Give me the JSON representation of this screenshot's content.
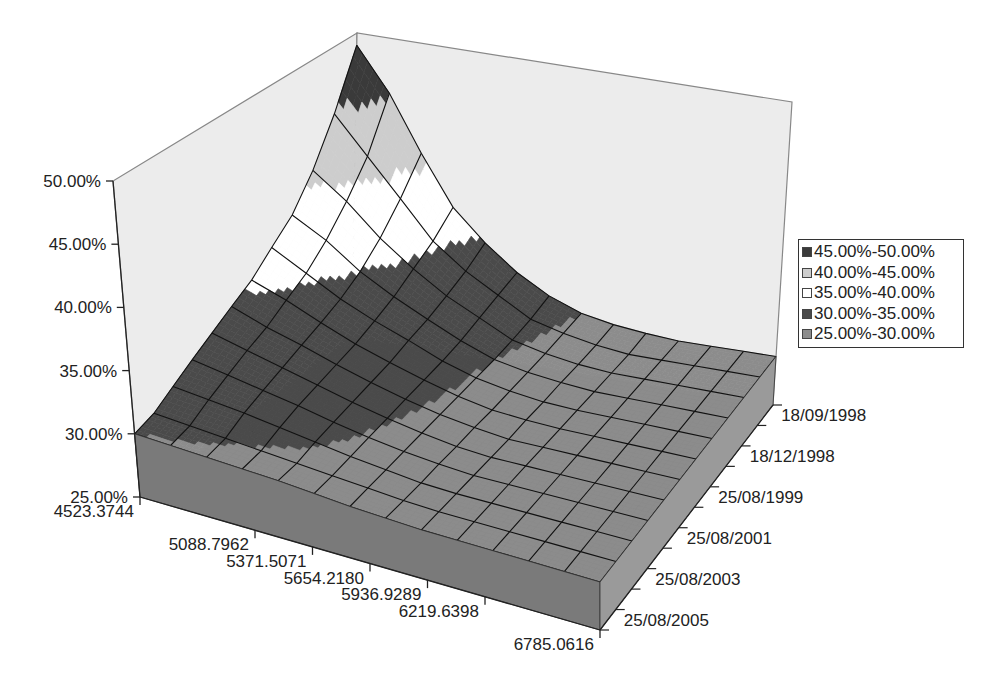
{
  "chart_data": {
    "type": "surface",
    "title": "",
    "xlabel": "",
    "ylabel": "",
    "zlabel": "",
    "x_categories": [
      "4523.3744",
      "5088.7962",
      "5371.5071",
      "5654.2180",
      "5936.9289",
      "6219.6398",
      "6785.0616"
    ],
    "y_categories": [
      "18/09/1998",
      "18/12/1998",
      "25/08/1999",
      "25/08/2001",
      "25/08/2003",
      "25/08/2005"
    ],
    "z_ticks": [
      "25.00%",
      "30.00%",
      "35.00%",
      "40.00%",
      "45.00%",
      "50.00%"
    ],
    "zlim": [
      0.25,
      0.5
    ],
    "grid_rows_note": "surface grid has 13 x-steps by 11 y-steps (more grid lines than labeled ticks)",
    "values_by_date": [
      {
        "date_index": 0,
        "values": [
          0.49,
          0.455,
          0.41,
          0.37,
          0.345,
          0.325,
          0.31,
          0.3,
          0.295,
          0.292,
          0.29,
          0.29,
          0.29,
          0.29
        ]
      },
      {
        "date_index": 1,
        "values": [
          0.445,
          0.415,
          0.385,
          0.355,
          0.335,
          0.32,
          0.305,
          0.298,
          0.293,
          0.29,
          0.29,
          0.29,
          0.29,
          0.29
        ]
      },
      {
        "date_index": 2,
        "values": [
          0.41,
          0.39,
          0.365,
          0.345,
          0.328,
          0.315,
          0.302,
          0.296,
          0.292,
          0.29,
          0.29,
          0.29,
          0.29,
          0.29
        ]
      },
      {
        "date_index": 3,
        "values": [
          0.385,
          0.37,
          0.35,
          0.335,
          0.322,
          0.31,
          0.3,
          0.295,
          0.292,
          0.29,
          0.29,
          0.29,
          0.29,
          0.29
        ]
      },
      {
        "date_index": 4,
        "values": [
          0.37,
          0.355,
          0.34,
          0.328,
          0.318,
          0.307,
          0.299,
          0.294,
          0.291,
          0.29,
          0.29,
          0.29,
          0.29,
          0.29
        ]
      },
      {
        "date_index": 5,
        "values": [
          0.355,
          0.345,
          0.333,
          0.322,
          0.313,
          0.305,
          0.298,
          0.293,
          0.291,
          0.29,
          0.29,
          0.29,
          0.29,
          0.29
        ]
      },
      {
        "date_index": 6,
        "values": [
          0.345,
          0.335,
          0.327,
          0.318,
          0.31,
          0.303,
          0.297,
          0.293,
          0.29,
          0.29,
          0.29,
          0.29,
          0.29,
          0.29
        ]
      },
      {
        "date_index": 7,
        "values": [
          0.335,
          0.328,
          0.321,
          0.314,
          0.307,
          0.301,
          0.296,
          0.292,
          0.29,
          0.29,
          0.29,
          0.29,
          0.29,
          0.29
        ]
      },
      {
        "date_index": 8,
        "values": [
          0.325,
          0.32,
          0.315,
          0.31,
          0.304,
          0.299,
          0.295,
          0.292,
          0.29,
          0.29,
          0.29,
          0.29,
          0.29,
          0.29
        ]
      },
      {
        "date_index": 9,
        "values": [
          0.315,
          0.312,
          0.309,
          0.305,
          0.301,
          0.297,
          0.294,
          0.291,
          0.29,
          0.29,
          0.29,
          0.29,
          0.29,
          0.29
        ]
      },
      {
        "date_index": 10,
        "values": [
          0.305,
          0.303,
          0.301,
          0.299,
          0.297,
          0.295,
          0.293,
          0.291,
          0.29,
          0.29,
          0.29,
          0.29,
          0.29,
          0.29
        ]
      },
      {
        "date_index": 11,
        "values": [
          0.3,
          0.299,
          0.298,
          0.297,
          0.296,
          0.294,
          0.292,
          0.291,
          0.29,
          0.29,
          0.29,
          0.29,
          0.29,
          0.29
        ]
      }
    ],
    "bands": [
      {
        "label": "45.00%-50.00%",
        "min": 0.45,
        "max": 0.5,
        "color": "#3a3a3a"
      },
      {
        "label": "40.00%-45.00%",
        "min": 0.4,
        "max": 0.45,
        "color": "#cdcdcd"
      },
      {
        "label": "35.00%-40.00%",
        "min": 0.35,
        "max": 0.4,
        "color": "#ffffff"
      },
      {
        "label": "30.00%-35.00%",
        "min": 0.3,
        "max": 0.35,
        "color": "#4a4a4a"
      },
      {
        "label": "25.00%-30.00%",
        "min": 0.25,
        "max": 0.3,
        "color": "#8c8c8c"
      }
    ],
    "legend_position": "right",
    "grid": true
  },
  "legend": {
    "items": [
      {
        "label": "45.00%-50.00%",
        "color": "#3a3a3a"
      },
      {
        "label": "40.00%-45.00%",
        "color": "#cdcdcd"
      },
      {
        "label": "35.00%-40.00%",
        "color": "#ffffff"
      },
      {
        "label": "30.00%-35.00%",
        "color": "#4a4a4a"
      },
      {
        "label": "25.00%-30.00%",
        "color": "#8c8c8c"
      }
    ]
  },
  "colors": {
    "wall": "#ececec",
    "floor": "#808080",
    "wall_edge": "#888888",
    "grid_line": "#111111",
    "axis": "#222222"
  }
}
